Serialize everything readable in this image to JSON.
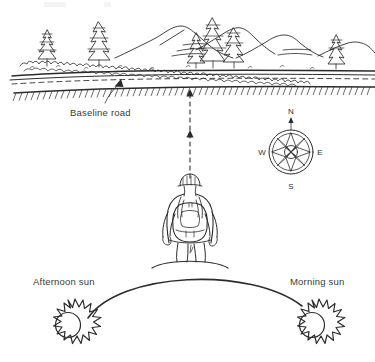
{
  "figure": {
    "type": "hand-drawn-illustration",
    "title": "Orientation diagram: hiker facing mountains across baseline road",
    "background_color": "#ffffff",
    "ink_color": "#2b2b2b",
    "text_color": "#3a3a3a"
  },
  "labels": {
    "baseline_road": "Baseline road",
    "afternoon_sun": "Afternoon sun",
    "morning_sun": "Morning sun"
  },
  "compass": {
    "name": "compass-rose",
    "north": "N",
    "east": "E",
    "south": "S",
    "west": "W",
    "points": 8
  },
  "scene": {
    "landscape": {
      "mountains": 4,
      "conifers": 6,
      "shrub_band": true,
      "road": {
        "center_line": "dashed",
        "embankment_hatching": true
      }
    },
    "hiker": {
      "name": "hiker-figure",
      "view": "from behind",
      "wearing": "backpack",
      "headwear": "hat"
    },
    "sight_line": {
      "style": "dashed",
      "arrowheads": 2,
      "direction": "from hiker toward road"
    },
    "sun_path": {
      "style": "arc",
      "from": "Morning sun",
      "to": "Afternoon sun"
    }
  }
}
